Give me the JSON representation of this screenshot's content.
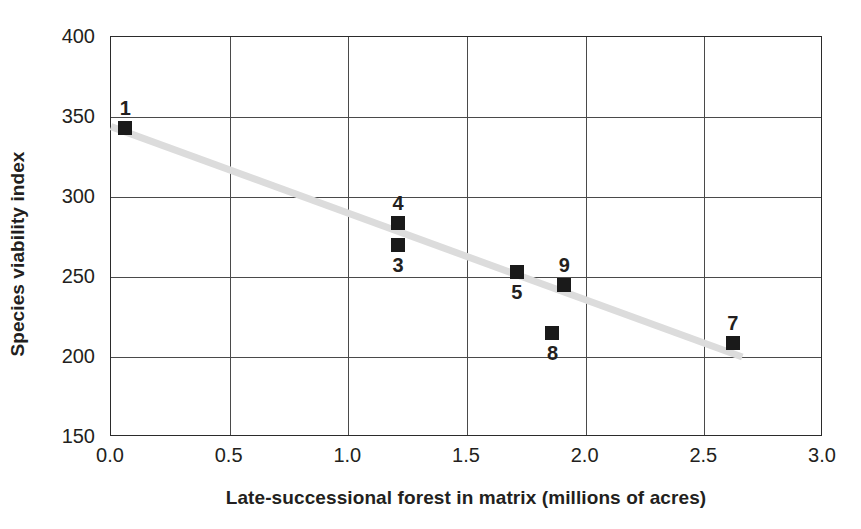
{
  "chart_data": {
    "type": "scatter",
    "title": "",
    "xlabel": "Late-successional forest in matrix (millions of acres)",
    "ylabel": "Species viability index",
    "xlim": [
      0.0,
      3.0
    ],
    "ylim": [
      150,
      400
    ],
    "grid": true,
    "legend": "none",
    "xticks": [
      "0.0",
      "0.5",
      "1.0",
      "1.5",
      "2.0",
      "2.5",
      "3.0"
    ],
    "xtick_values": [
      0.0,
      0.5,
      1.0,
      1.5,
      2.0,
      2.5,
      3.0
    ],
    "yticks": [
      "150",
      "200",
      "250",
      "300",
      "350",
      "400"
    ],
    "ytick_values": [
      150,
      200,
      250,
      300,
      350,
      400
    ],
    "points": [
      {
        "label": "1",
        "x": 0.06,
        "y": 343,
        "label_pos": "above"
      },
      {
        "label": "4",
        "x": 1.21,
        "y": 284,
        "label_pos": "above"
      },
      {
        "label": "3",
        "x": 1.21,
        "y": 270,
        "label_pos": "below"
      },
      {
        "label": "5",
        "x": 1.71,
        "y": 253,
        "label_pos": "below"
      },
      {
        "label": "9",
        "x": 1.91,
        "y": 245,
        "label_pos": "above"
      },
      {
        "label": "8",
        "x": 1.86,
        "y": 215,
        "label_pos": "below"
      },
      {
        "label": "7",
        "x": 2.62,
        "y": 209,
        "label_pos": "above"
      }
    ],
    "trendline": {
      "x0": 0.0,
      "y0": 344,
      "x1": 2.66,
      "y1": 200,
      "color": "#dcdcdc"
    },
    "marker_color": "#1a1a1a",
    "marker_shape": "square",
    "axis_color": "#2b2b2b",
    "grid_color": "#4a4a4a",
    "background": "#ffffff"
  }
}
